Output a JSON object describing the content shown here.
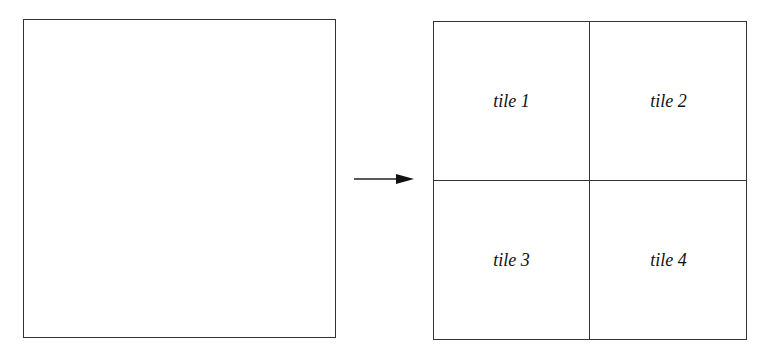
{
  "diagram": {
    "source_box": {
      "label": ""
    },
    "arrow": {
      "direction": "right"
    },
    "tiles": [
      {
        "label": "tile 1"
      },
      {
        "label": "tile 2"
      },
      {
        "label": "tile 3"
      },
      {
        "label": "tile 4"
      }
    ],
    "colors": {
      "line": "#333333",
      "background": "#ffffff"
    }
  }
}
